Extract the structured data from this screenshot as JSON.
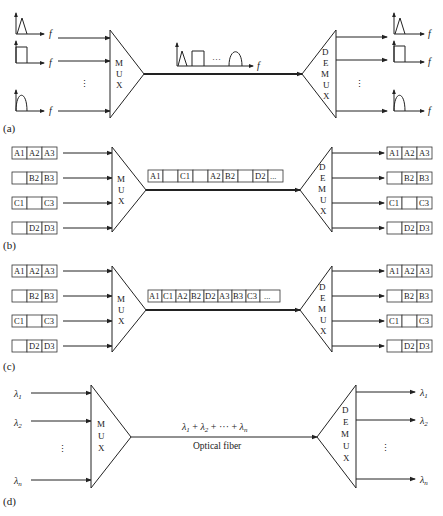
{
  "panels": {
    "a": {
      "label": "(a)",
      "title": "Frequency division multiplexing",
      "mux_label": [
        "M",
        "U",
        "X"
      ],
      "demux_label": [
        "D",
        "E",
        "M",
        "U",
        "X"
      ],
      "axis_label": "f",
      "ellipsis_vertical": "⋮",
      "ellipsis_horizontal": "···",
      "input_spectra": [
        "triangle",
        "rectangle",
        "half-sine"
      ],
      "output_spectra": [
        "triangle",
        "rectangle",
        "half-sine"
      ],
      "combined_spectrum": [
        "triangle",
        "rectangle",
        "ellipsis",
        "half-sine"
      ]
    },
    "b": {
      "label": "(b)",
      "title": "Synchronous time division multiplexing",
      "mux_label": [
        "M",
        "U",
        "X"
      ],
      "demux_label": [
        "D",
        "E",
        "M",
        "U",
        "X"
      ],
      "inputs": [
        [
          "A1",
          "A2",
          "A3"
        ],
        [
          "",
          "B2",
          "B3"
        ],
        [
          "C1",
          "",
          "C3"
        ],
        [
          "",
          "D2",
          "D3"
        ]
      ],
      "frame": [
        "A1",
        "",
        "C1",
        "",
        "A2",
        "B2",
        "",
        "D2",
        "..."
      ],
      "outputs": [
        [
          "A1",
          "A2",
          "A3"
        ],
        [
          "",
          "B2",
          "B3"
        ],
        [
          "C1",
          "",
          "C3"
        ],
        [
          "",
          "D2",
          "D3"
        ]
      ]
    },
    "c": {
      "label": "(c)",
      "title": "Statistical time division multiplexing",
      "mux_label": [
        "M",
        "U",
        "X"
      ],
      "demux_label": [
        "D",
        "E",
        "M",
        "U",
        "X"
      ],
      "inputs": [
        [
          "A1",
          "A2",
          "A3"
        ],
        [
          "",
          "B2",
          "B3"
        ],
        [
          "C1",
          "",
          "C3"
        ],
        [
          "",
          "D2",
          "D3"
        ]
      ],
      "frame": [
        "A1",
        "C1",
        "A2",
        "B2",
        "D2",
        "A3",
        "B3",
        "C3",
        "..."
      ],
      "outputs": [
        [
          "A1",
          "A2",
          "A3"
        ],
        [
          "",
          "B2",
          "B3"
        ],
        [
          "C1",
          "",
          "C3"
        ],
        [
          "",
          "D2",
          "D3"
        ]
      ]
    },
    "d": {
      "label": "(d)",
      "title": "Wavelength division multiplexing",
      "mux_label": [
        "M",
        "U",
        "X"
      ],
      "demux_label": [
        "D",
        "E",
        "M",
        "U",
        "X"
      ],
      "inputs": [
        "λ1",
        "λ2",
        "λn"
      ],
      "input_subscripts": [
        "1",
        "2",
        "n"
      ],
      "outputs_subscripts": [
        "1",
        "2",
        "n"
      ],
      "lambda_symbol": "λ",
      "combined_signal": "λ1 + λ2 + ··· + λn",
      "combined_parts": [
        "λ",
        "1",
        " + ",
        "λ",
        "2",
        " + ··· + ",
        "λ",
        "n"
      ],
      "fiber_label": "Optical fiber",
      "ellipsis_vertical": "⋮"
    }
  },
  "colors": {
    "line": "#222222",
    "background": "#ffffff"
  }
}
